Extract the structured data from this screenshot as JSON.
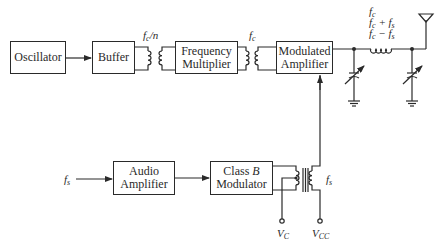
{
  "diagram": {
    "type": "block-diagram",
    "title": "",
    "blocks": {
      "oscillator": "Oscillator",
      "buffer": "Buffer",
      "frequency_multiplier": "Frequency\nMultiplier",
      "modulated_amplifier": "Modulated\nAmplifier",
      "audio_amplifier": "Audio\nAmplifier",
      "class_b_modulator_prefix": "Class ",
      "class_b_modulator_letter": "B",
      "class_b_modulator_suffix": "Modulator"
    },
    "labels": {
      "buffer_out_f": "f",
      "buffer_out_sub": "c",
      "buffer_out_div": "/n",
      "mult_out_f": "f",
      "mult_out_sub": "c",
      "output_line1_f": "f",
      "output_line1_sub": "c",
      "output_line2_f": "f",
      "output_line2_sub": "c",
      "output_line2_op": " + f",
      "output_line2_sub2": "s",
      "output_line3_f": "f",
      "output_line3_sub": "c",
      "output_line3_op": " − f",
      "output_line3_sub2": "s",
      "audio_input_f": "f",
      "audio_input_sub": "s",
      "transformer_secondary_f": "f",
      "transformer_secondary_sub": "s",
      "vc_v": "V",
      "vc_sub": "C",
      "vcc_v": "V",
      "vcc_sub": "CC"
    },
    "connections": [
      {
        "from": "Oscillator",
        "to": "Buffer",
        "kind": "arrow"
      },
      {
        "from": "Buffer",
        "to": "Frequency Multiplier",
        "kind": "transformer",
        "signal": "fc/n"
      },
      {
        "from": "Frequency Multiplier",
        "to": "Modulated Amplifier",
        "kind": "transformer",
        "signal": "fc"
      },
      {
        "from": "Modulated Amplifier",
        "to": "Antenna",
        "kind": "pi-network",
        "signal": "fc, fc+fs, fc−fs"
      },
      {
        "from": "fs",
        "to": "Audio Amplifier",
        "kind": "arrow"
      },
      {
        "from": "Audio Amplifier",
        "to": "Class B Modulator",
        "kind": "arrow"
      },
      {
        "from": "Class B Modulator",
        "to": "Modulated Amplifier",
        "kind": "transformer",
        "signal": "fs"
      }
    ],
    "colors": {
      "ink": "#2a2a2a",
      "background": "#ffffff"
    }
  }
}
